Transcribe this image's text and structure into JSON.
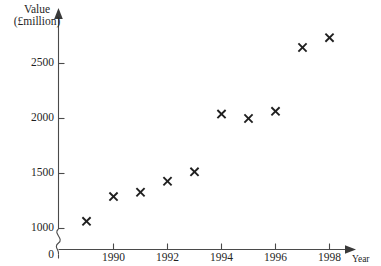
{
  "chart_data": {
    "type": "scatter",
    "title": "",
    "xlabel": "Year",
    "ylabel": "Value (£million)",
    "ylabel_line1": "Value",
    "ylabel_line2": "(£million)",
    "x": [
      1989,
      1990,
      1991,
      1992,
      1993,
      1994,
      1995,
      1996,
      1997,
      1998
    ],
    "values": [
      1065,
      1290,
      1330,
      1430,
      1515,
      2040,
      2000,
      2065,
      2645,
      2735
    ],
    "series": [
      {
        "name": "Value",
        "points": [
          {
            "x": 1989,
            "y": 1065
          },
          {
            "x": 1990,
            "y": 1290
          },
          {
            "x": 1991,
            "y": 1330
          },
          {
            "x": 1992,
            "y": 1430
          },
          {
            "x": 1993,
            "y": 1515
          },
          {
            "x": 1994,
            "y": 2040
          },
          {
            "x": 1995,
            "y": 2000
          },
          {
            "x": 1996,
            "y": 2065
          },
          {
            "x": 1997,
            "y": 2645
          },
          {
            "x": 1998,
            "y": 2735
          }
        ]
      }
    ],
    "xlim": [
      1988.2,
      1999.2
    ],
    "ylim": [
      1000,
      2900
    ],
    "ytick_labels": [
      "2500",
      "2000",
      "1500",
      "1000"
    ],
    "yticks": [
      2500,
      2000,
      1500,
      1000
    ],
    "xtick_labels": [
      "1990",
      "1992",
      "1994",
      "1996",
      "1998"
    ],
    "xticks": [
      1990,
      1992,
      1994,
      1996,
      1998
    ],
    "origin_label": "0",
    "axis_break": true,
    "axis_break_note": "y-axis broken between 0 and 1000",
    "grid": false,
    "legend": false,
    "marker_style": "x",
    "marker_color": "#1f1f1f",
    "axis_color": "#4a4a4a",
    "background_color": "#ffffff"
  }
}
